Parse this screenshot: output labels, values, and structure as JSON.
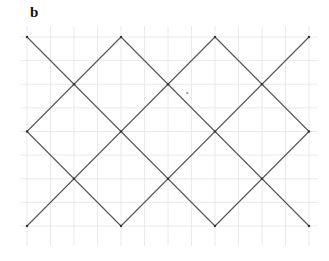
{
  "figure": {
    "panel_label": "b",
    "colors": {
      "background": "#ffffff",
      "lattice_line": "#555555",
      "grid_line": "#e4e4e4"
    },
    "lattice": {
      "x0": 27,
      "y0": 37,
      "step_x": 47,
      "step_y": 47.25,
      "cols": 6,
      "rows": 4
    },
    "graph_paper": {
      "x_start": 20,
      "x_end": 318,
      "y_start": 26,
      "y_end": 246,
      "half_step_x": 23.5,
      "half_step_y": 23.6
    },
    "annotation_mark": {
      "x": 185,
      "y": 95,
      "text": "∘"
    }
  }
}
